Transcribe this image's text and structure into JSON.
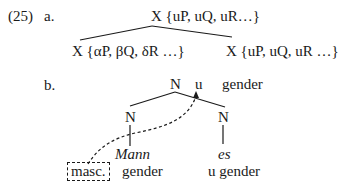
{
  "example_number": "(25)",
  "a": {
    "label": "a.",
    "root": "X {uP, uQ, uR…}",
    "left_child": "X {αP, βQ, δR …}",
    "right_child": "X {uP, uQ, uR …}"
  },
  "b": {
    "label": "b.",
    "root_node": "N",
    "root_u": "u",
    "root_feature": "gender",
    "left_node": "N",
    "right_node": "N",
    "left_word": "Mann",
    "right_word": "es",
    "left_value_boxed": "masc.",
    "left_feature": "gender",
    "right_feature": "u gender"
  }
}
